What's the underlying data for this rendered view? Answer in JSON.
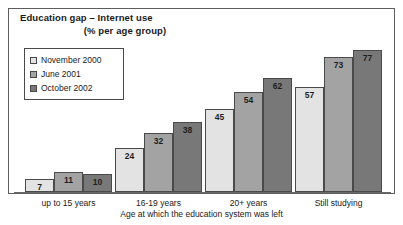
{
  "chart_data": {
    "type": "bar",
    "title": "Education gap – Internet use",
    "subtitle": "(% per age group)",
    "xlabel": "Age at which the education system was left",
    "ylabel": "",
    "ylim": [
      0,
      80
    ],
    "grid": false,
    "legend_position": "top-left",
    "categories": [
      "up to 15 years",
      "16-19 years",
      "20+ years",
      "Still studying"
    ],
    "series": [
      {
        "name": "November 2000",
        "color": "#e3e3e3",
        "values": [
          7,
          24,
          45,
          57
        ]
      },
      {
        "name": "June 2001",
        "color": "#a3a3a3",
        "values": [
          11,
          32,
          54,
          73
        ]
      },
      {
        "name": "October 2002",
        "color": "#787878",
        "values": [
          10,
          38,
          62,
          77
        ]
      }
    ]
  },
  "legend": {
    "items": [
      {
        "label": "November 2000",
        "swatch": "#e3e3e3"
      },
      {
        "label": "June 2001",
        "swatch": "#a3a3a3"
      },
      {
        "label": "October 2002",
        "swatch": "#787878"
      }
    ]
  },
  "colors": {
    "series_light": "#e3e3e3",
    "series_medium": "#a3a3a3",
    "series_dark": "#787878",
    "outline": "#4a4a4a",
    "frame": "#5d5d5d",
    "background": "#ffffff",
    "text": "#1a1a1a"
  }
}
